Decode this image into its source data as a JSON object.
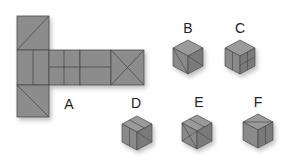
{
  "puzzle": {
    "net_label": "A",
    "options": [
      {
        "label": "B"
      },
      {
        "label": "C"
      },
      {
        "label": "D"
      },
      {
        "label": "E"
      },
      {
        "label": "F"
      }
    ]
  },
  "colors": {
    "face": "#8c8c8c",
    "face_light": "#9a9a9a",
    "face_dark": "#7a7a7a",
    "line": "#4a4a4a",
    "text": "#222222"
  }
}
